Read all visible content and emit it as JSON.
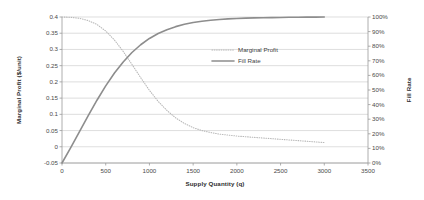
{
  "chart_data": {
    "type": "line",
    "title": "",
    "xlabel": "Supply Quantity (q)",
    "ylabel": "Marginal Profit ($/unit)",
    "y2label": "Fill Rate",
    "xlim": [
      0,
      3500
    ],
    "ylim": [
      -0.05,
      0.4
    ],
    "y2lim": [
      0,
      1
    ],
    "grid": true,
    "legend_position": "inside-upper-right",
    "xticks": [
      "0",
      "500",
      "1000",
      "1500",
      "2000",
      "2500",
      "3000",
      "3500"
    ],
    "xtick_values": [
      0,
      500,
      1000,
      1500,
      2000,
      2500,
      3000,
      3500
    ],
    "yticks": [
      "-0.05",
      "0",
      "0.05",
      "0.1",
      "0.15",
      "0.2",
      "0.25",
      "0.3",
      "0.35",
      "0.4"
    ],
    "ytick_values": [
      -0.05,
      0,
      0.05,
      0.1,
      0.15,
      0.2,
      0.25,
      0.3,
      0.35,
      0.4
    ],
    "y2ticks": [
      "0%",
      "10%",
      "20%",
      "30%",
      "40%",
      "50%",
      "60%",
      "70%",
      "80%",
      "90%",
      "100%"
    ],
    "y2tick_values": [
      0,
      0.1,
      0.2,
      0.3,
      0.4,
      0.5,
      0.6,
      0.7,
      0.8,
      0.9,
      1.0
    ],
    "series": [
      {
        "name": "Marginal Profit",
        "axis": "left",
        "style": "dotted",
        "color": "#b8b8b8",
        "x": [
          0,
          100,
          200,
          300,
          400,
          500,
          600,
          700,
          800,
          900,
          1000,
          1100,
          1200,
          1300,
          1400,
          1500,
          1600,
          1700,
          1800,
          1900,
          2000,
          2100,
          2200,
          2300,
          2400,
          2500,
          2600,
          2700,
          2800,
          2900,
          3000
        ],
        "values": [
          0.4,
          0.399,
          0.396,
          0.389,
          0.377,
          0.357,
          0.329,
          0.294,
          0.254,
          0.213,
          0.174,
          0.14,
          0.112,
          0.089,
          0.072,
          0.059,
          0.05,
          0.044,
          0.039,
          0.036,
          0.033,
          0.031,
          0.029,
          0.027,
          0.025,
          0.023,
          0.021,
          0.019,
          0.017,
          0.015,
          0.013
        ]
      },
      {
        "name": "Fill Rate",
        "axis": "right",
        "style": "solid",
        "color": "#8d8d8d",
        "x": [
          0,
          100,
          200,
          300,
          400,
          500,
          600,
          700,
          800,
          900,
          1000,
          1100,
          1200,
          1300,
          1400,
          1500,
          1600,
          1700,
          1800,
          1900,
          2000,
          2100,
          2200,
          2300,
          2400,
          2500,
          2600,
          2700,
          2800,
          2900,
          3000
        ],
        "values": [
          0.0,
          0.105,
          0.215,
          0.325,
          0.43,
          0.528,
          0.616,
          0.692,
          0.757,
          0.81,
          0.853,
          0.887,
          0.913,
          0.934,
          0.95,
          0.962,
          0.971,
          0.978,
          0.983,
          0.987,
          0.99,
          0.992,
          0.994,
          0.995,
          0.996,
          0.997,
          0.998,
          0.998,
          0.999,
          0.999,
          1.0
        ]
      }
    ],
    "legend": [
      {
        "label": "Marginal Profit",
        "style": "dotted",
        "color": "#b8b8b8"
      },
      {
        "label": "Fill Rate",
        "style": "solid",
        "color": "#8d8d8d"
      }
    ]
  }
}
